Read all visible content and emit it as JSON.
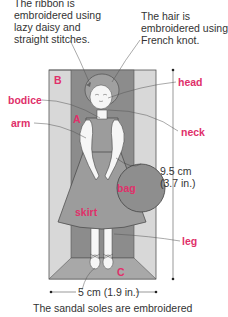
{
  "callouts": {
    "ribbon": [
      "The ribbon is",
      "embroidered using",
      "lazy daisy and",
      "straight stitches."
    ],
    "hair": [
      "The hair is",
      "embroidered using",
      "French knot."
    ],
    "sandal": "The sandal soles are embroidered"
  },
  "labels": {
    "head": "head",
    "bodice": "bodice",
    "arm": "arm",
    "neck": "neck",
    "bag": "bag",
    "skirt": "skirt",
    "leg": "leg",
    "A": "A",
    "B": "B",
    "C": "C"
  },
  "dimensions": {
    "height_cm": "9.5 cm",
    "height_in": "(3.7 in.)",
    "width": "5 cm (1.9 in.)"
  },
  "colors": {
    "label": "#e0306a",
    "outer_frame": "#d4d4d4",
    "inner_panel": "#8a8a8a",
    "figure_fill": "#9a9a9a",
    "skin": "#f4f4f4"
  }
}
